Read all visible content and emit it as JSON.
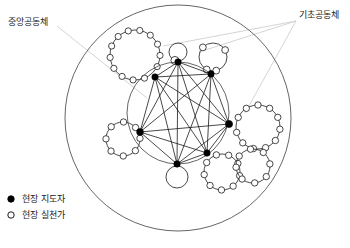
{
  "diagram": {
    "title_labels": {
      "central_community": "중앙공동체",
      "basic_community": "기초공동체"
    },
    "legend": {
      "items": [
        {
          "marker": "filled-circle",
          "label": "현장 지도자"
        },
        {
          "marker": "open-circle",
          "label": "현장 실천가"
        }
      ]
    },
    "caption": "",
    "colors": {
      "stroke": "#1a1a1a",
      "leader_line": "#cfcfcf",
      "background": "#ffffff",
      "node_fill": "#000000",
      "open_node_fill": "#ffffff"
    },
    "outer_circle": {
      "cx": 178,
      "cy": 118,
      "r": 113
    },
    "central_circle": {
      "cx": 178,
      "cy": 113,
      "r": 51
    },
    "leaders": [
      {
        "id": "leader-top-center",
        "cx": 178,
        "cy": 62,
        "r": 3.2
      },
      {
        "id": "leader-top-right",
        "cx": 211,
        "cy": 74,
        "r": 3.2
      },
      {
        "id": "leader-right",
        "cx": 229,
        "cy": 124,
        "r": 3.6
      },
      {
        "id": "leader-bottom-right",
        "cx": 207,
        "cy": 153,
        "r": 3.2
      },
      {
        "id": "leader-bottom",
        "cx": 177,
        "cy": 164,
        "r": 3.2
      },
      {
        "id": "leader-left",
        "cx": 140,
        "cy": 132,
        "r": 3.4
      },
      {
        "id": "leader-top-left",
        "cx": 155,
        "cy": 77,
        "r": 3.2
      }
    ],
    "satellite_communities": [
      {
        "id": "sat-top-left",
        "cx": 135,
        "cy": 55,
        "r": 25,
        "count": 13,
        "open_r": 3.1,
        "anchor": "leader-top-left"
      },
      {
        "id": "sat-top-center",
        "cx": 178,
        "cy": 52,
        "r": 9,
        "count": 1,
        "open_r": 4.0,
        "anchor": "leader-top-center"
      },
      {
        "id": "sat-top-right",
        "cx": 213,
        "cy": 57,
        "r": 14,
        "count": 4,
        "open_r": 3.4,
        "anchor": "leader-top-right"
      },
      {
        "id": "sat-right",
        "cx": 258,
        "cy": 127,
        "r": 22,
        "count": 11,
        "open_r": 3.2,
        "anchor": "leader-right"
      },
      {
        "id": "sat-left",
        "cx": 123,
        "cy": 139,
        "r": 17,
        "count": 8,
        "open_r": 3.2,
        "anchor": "leader-left"
      },
      {
        "id": "sat-bottom-right-a",
        "cx": 222,
        "cy": 172,
        "r": 18,
        "count": 9,
        "open_r": 3.2,
        "anchor": "leader-bottom-right"
      },
      {
        "id": "sat-bottom-right-b",
        "cx": 253,
        "cy": 166,
        "r": 17,
        "count": 8,
        "open_r": 3.2,
        "anchor": "leader-bottom-right"
      },
      {
        "id": "sat-bottom-plain",
        "cx": 177,
        "cy": 177,
        "r": 11,
        "count": 0,
        "open_r": 0,
        "anchor": "leader-bottom"
      }
    ],
    "annotations": [
      {
        "id": "ann-central",
        "text": "중앙공동체",
        "text_x": 8,
        "text_y": 22,
        "lines": [
          {
            "x1": 57,
            "y1": 26,
            "x2": 147,
            "y2": 98
          }
        ]
      },
      {
        "id": "ann-basic",
        "text": "기초공동체",
        "text_x": 299,
        "text_y": 15,
        "lines": [
          {
            "x1": 296,
            "y1": 21,
            "x2": 163,
            "y2": 46
          },
          {
            "x1": 296,
            "y1": 21,
            "x2": 199,
            "y2": 52
          },
          {
            "x1": 296,
            "y1": 21,
            "x2": 245,
            "y2": 113
          }
        ]
      }
    ],
    "chords": [
      [
        "leader-top-center",
        "leader-top-right"
      ],
      [
        "leader-top-center",
        "leader-right"
      ],
      [
        "leader-top-center",
        "leader-bottom-right"
      ],
      [
        "leader-top-center",
        "leader-bottom"
      ],
      [
        "leader-top-center",
        "leader-left"
      ],
      [
        "leader-top-center",
        "leader-top-left"
      ],
      [
        "leader-top-right",
        "leader-right"
      ],
      [
        "leader-top-right",
        "leader-bottom-right"
      ],
      [
        "leader-top-right",
        "leader-bottom"
      ],
      [
        "leader-top-right",
        "leader-left"
      ],
      [
        "leader-top-right",
        "leader-top-left"
      ],
      [
        "leader-right",
        "leader-bottom-right"
      ],
      [
        "leader-right",
        "leader-bottom"
      ],
      [
        "leader-right",
        "leader-left"
      ],
      [
        "leader-right",
        "leader-top-left"
      ],
      [
        "leader-bottom-right",
        "leader-bottom"
      ],
      [
        "leader-bottom-right",
        "leader-left"
      ],
      [
        "leader-bottom-right",
        "leader-top-left"
      ],
      [
        "leader-bottom",
        "leader-left"
      ],
      [
        "leader-bottom",
        "leader-top-left"
      ],
      [
        "leader-left",
        "leader-top-left"
      ]
    ],
    "legend_layout": {
      "x_marker": 11,
      "x_text": 22,
      "y_first": 199,
      "y_step": 16,
      "marker_r": 3.2
    }
  }
}
